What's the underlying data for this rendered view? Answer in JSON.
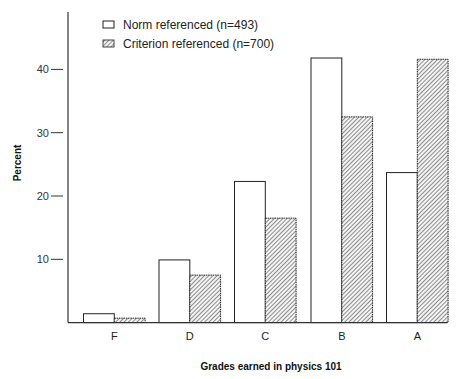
{
  "chart_data": {
    "type": "bar",
    "title": "",
    "xlabel": "Grades earned in physics 101",
    "ylabel": "Percent",
    "categories": [
      "F",
      "D",
      "C",
      "B",
      "A"
    ],
    "series": [
      {
        "name": "Norm referenced (n=493)",
        "pattern": "open",
        "values": [
          1.4,
          9.9,
          22.3,
          41.8,
          23.7
        ]
      },
      {
        "name": "Criterion referenced (n=700)",
        "pattern": "hatched",
        "values": [
          0.7,
          7.5,
          16.5,
          32.5,
          41.6
        ]
      }
    ],
    "yticks": [
      10,
      20,
      30,
      40
    ],
    "ylim": [
      0,
      49
    ],
    "grid": false,
    "legend_position": "top-left inside"
  },
  "colors": {
    "axis": "#333333",
    "bar_outline": "#222222",
    "hatch": "#555555",
    "background": "#ffffff"
  }
}
